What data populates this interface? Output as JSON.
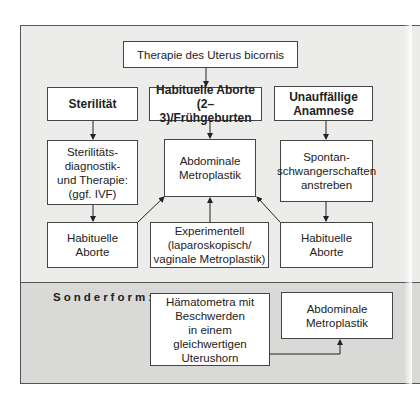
{
  "diagram": {
    "title": "Therapie des Uterus bicornis",
    "columns": [
      {
        "header": "Sterilität",
        "step": "Sterilitäts-\ndiagnostik-\nund Therapie:\n(ggf. IVF)",
        "outcome": "Habituelle\nAborte"
      },
      {
        "header": "Habituelle Aborte\n(2–3)/Frühgeburten",
        "step": "Abdominale\nMetroplastik",
        "outcome": "Experimentell\n(laparoskopisch/\nvaginale Metroplastik)"
      },
      {
        "header": "Unauffällige\nAnamnese",
        "step": "Spontan-\nschwangerschaften\nanstreben",
        "outcome": "Habituelle\nAborte"
      }
    ],
    "special": {
      "label": "Sonderform:",
      "condition": "Hämatometra mit\nBeschwerden\nin einem\ngleichwertigen\nUterushorn",
      "therapy": "Abdominale\nMetroplastik"
    },
    "colors": {
      "upper_panel": "#ececea",
      "lower_panel": "#d9d9d7",
      "box": "#ffffff",
      "line": "#333333"
    }
  }
}
